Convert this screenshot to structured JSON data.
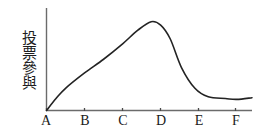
{
  "chart_data": {
    "type": "line",
    "title": "",
    "subtitle": "",
    "ylabel": "投票參與",
    "xlabel": "",
    "categories": [
      "A",
      "B",
      "C",
      "D",
      "E",
      "F"
    ],
    "x": [
      0,
      1,
      2,
      3,
      4,
      5
    ],
    "series": [
      {
        "name": "投票參與",
        "color": "#232323",
        "points": [
          {
            "x": 0.0,
            "y": 0.0
          },
          {
            "x": 0.25,
            "y": 7.0
          },
          {
            "x": 0.5,
            "y": 13.0
          },
          {
            "x": 1.0,
            "y": 22.0
          },
          {
            "x": 1.5,
            "y": 30.0
          },
          {
            "x": 2.0,
            "y": 39.0
          },
          {
            "x": 2.4,
            "y": 47.0
          },
          {
            "x": 2.75,
            "y": 52.0
          },
          {
            "x": 3.0,
            "y": 50.0
          },
          {
            "x": 3.25,
            "y": 42.0
          },
          {
            "x": 3.55,
            "y": 25.0
          },
          {
            "x": 3.9,
            "y": 13.0
          },
          {
            "x": 4.25,
            "y": 8.0
          },
          {
            "x": 4.7,
            "y": 7.0
          },
          {
            "x": 5.0,
            "y": 6.5
          },
          {
            "x": 5.4,
            "y": 7.5
          }
        ]
      }
    ],
    "peak": {
      "category_between": [
        "C",
        "D"
      ],
      "value": 52
    },
    "ylim": [
      0,
      60
    ],
    "xlim": [
      0,
      5.4
    ],
    "grid": false,
    "legend": false,
    "axes": {
      "x_axis_visible": true,
      "y_axis_visible": true,
      "tick_marks": true,
      "y_tick_labels": []
    }
  },
  "figure": {
    "y_axis_label": "投票參與",
    "x_tick_labels": [
      "A",
      "B",
      "C",
      "D",
      "E",
      "F"
    ],
    "line_color": "#232323",
    "axis_color": "#6b6b6b",
    "background_color": "#ffffff"
  }
}
